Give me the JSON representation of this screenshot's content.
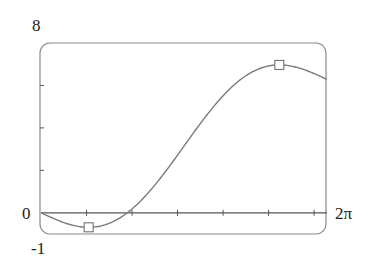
{
  "chart_data": {
    "type": "line",
    "title": "",
    "function": "f(x) = x - 2 sin x",
    "xlabel": "",
    "ylabel": "",
    "xlim": [
      0,
      6.2832
    ],
    "ylim": [
      -1,
      8
    ],
    "x_tick_labels": {
      "left": "0",
      "right": "2π"
    },
    "y_tick_labels": {
      "top": "8",
      "bottom": "-1",
      "origin": "0"
    },
    "x_ticks": [
      1,
      2,
      3,
      4,
      5,
      6
    ],
    "y_ticks": [
      2,
      4,
      6
    ],
    "grid": false,
    "series": [
      {
        "name": "f(x)",
        "x": [
          0,
          0.5,
          1.0472,
          1.5,
          2.0,
          2.5,
          3.0,
          3.5,
          4.0,
          4.5,
          5.0,
          5.236,
          5.5,
          6.0,
          6.2832
        ],
        "y": [
          0,
          -0.459,
          -0.685,
          -0.495,
          0.181,
          1.303,
          2.718,
          4.202,
          5.514,
          6.455,
          6.918,
          6.968,
          6.911,
          6.559,
          6.283
        ]
      }
    ],
    "markers": [
      {
        "label": "local minimum",
        "x": 1.0472,
        "y": -0.685,
        "shape": "square"
      },
      {
        "label": "local maximum",
        "x": 5.236,
        "y": 6.968,
        "shape": "square"
      }
    ],
    "colors": {
      "curve": "#7a7a7a",
      "frame": "#8a8a8a",
      "axis": "#555555",
      "text": "#222222"
    }
  }
}
